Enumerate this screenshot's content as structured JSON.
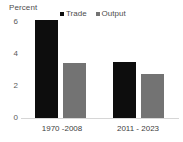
{
  "chart_data": {
    "type": "bar",
    "title": "",
    "ylabel": "Percent",
    "xlabel": "",
    "categories": [
      "1970 -2008",
      "2011 - 2023"
    ],
    "series": [
      {
        "name": "Trade",
        "values": [
          6.0,
          3.4
        ],
        "color": "#0d0d0d"
      },
      {
        "name": "Output",
        "values": [
          3.35,
          2.7
        ],
        "color": "#737373"
      }
    ],
    "ylim": [
      0,
      6
    ],
    "yticks": [
      "0",
      "2",
      "4",
      "6"
    ],
    "ytick_values": [
      0,
      2,
      4,
      6
    ],
    "grid": false,
    "legend_position": "top-center"
  },
  "legend": {
    "items": [
      {
        "label": "Trade",
        "swatch": "legend-swatch-trade"
      },
      {
        "label": "Output",
        "swatch": "legend-swatch-output"
      }
    ]
  },
  "axis": {
    "y_title": "Percent",
    "y_ticks": [
      "6",
      "4",
      "2",
      "0"
    ]
  },
  "x_labels": [
    "1970 -2008",
    "2011 - 2023"
  ]
}
